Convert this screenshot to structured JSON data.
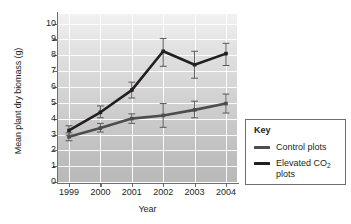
{
  "chart_data": {
    "type": "line",
    "title": "",
    "xlabel": "Year",
    "ylabel": "Mean plant dry biomass (g)",
    "categories": [
      "1999",
      "2000",
      "2001",
      "2002",
      "2003",
      "2004"
    ],
    "x": [
      1999,
      2000,
      2001,
      2002,
      2003,
      2004
    ],
    "xlim": [
      1998.6,
      2004.4
    ],
    "ylim": [
      0,
      10.6
    ],
    "yticks": [
      0,
      1,
      2,
      3,
      4,
      5,
      6,
      7,
      8,
      9,
      10
    ],
    "ytick_labels": [
      "0",
      "1",
      "2",
      "3",
      "4",
      "5",
      "6",
      "7",
      "8",
      "9",
      "10"
    ],
    "grid": "horizontal-and-vertical-white",
    "legend_position": "right-outside",
    "series": [
      {
        "name": "Control plots",
        "color": "#4d4d4f",
        "values": [
          2.85,
          3.4,
          4.0,
          4.2,
          4.55,
          4.95
        ],
        "error_low": [
          2.6,
          3.15,
          3.7,
          3.45,
          4.05,
          4.35
        ],
        "error_high": [
          3.1,
          3.7,
          4.3,
          4.95,
          5.1,
          5.55
        ]
      },
      {
        "name": "Elevated CO2 plots",
        "color": "#231f20",
        "values": [
          3.25,
          4.4,
          5.8,
          8.25,
          7.4,
          8.1
        ],
        "error_low": [
          2.95,
          4.05,
          5.3,
          7.3,
          6.55,
          7.35
        ],
        "error_high": [
          3.55,
          4.8,
          6.3,
          9.05,
          8.25,
          8.75
        ]
      }
    ]
  },
  "legend": {
    "title": "Key",
    "items": [
      {
        "label": "Control plots",
        "label_sub": "",
        "label_tail": "",
        "color": "#4d4d4f"
      },
      {
        "label": "Elevated CO",
        "label_sub": "2",
        "label_tail": " plots",
        "color": "#231f20"
      }
    ]
  },
  "axis": {
    "x_title": "Year",
    "y_title": "Mean plant dry biomass (g)"
  }
}
